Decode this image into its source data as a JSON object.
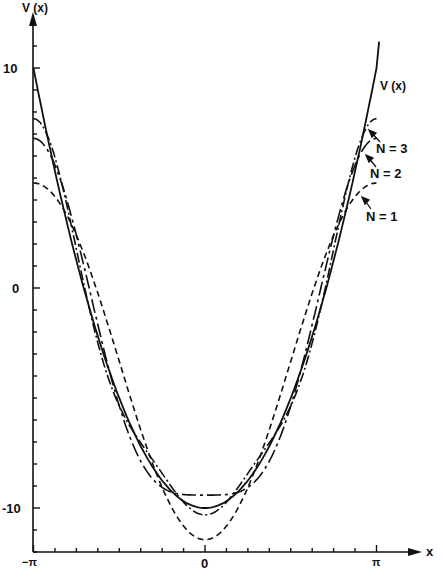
{
  "chart_data": {
    "type": "line",
    "title": "",
    "xlabel": "x",
    "ylabel": "V(x)",
    "xlim": [
      -3.14159,
      3.14159
    ],
    "ylim": [
      -12,
      12
    ],
    "x_ticks": {
      "labels": [
        "-π",
        "0",
        "π"
      ],
      "values": [
        -3.14159,
        0,
        3.14159
      ],
      "minor_step": 0.4
    },
    "y_ticks": {
      "labels": [
        "10",
        "0",
        "-10"
      ],
      "values": [
        10,
        0,
        -10
      ],
      "minor_step": 1
    },
    "grid": false,
    "legend": "inline annotations with arrows",
    "series": [
      {
        "name": "V(x)",
        "style": "solid",
        "formula": "20*(x/pi)^2 - 10",
        "x": [
          -3.1416,
          -1.5708,
          0,
          1.5708,
          3.1416
        ],
        "values": [
          10,
          -5,
          -10,
          -5,
          10
        ]
      },
      {
        "name": "N = 1",
        "style": "dashed",
        "formula": "-3.333 - 8.106*cos(x)",
        "x": [
          -3.1416,
          -1.5708,
          0,
          1.5708,
          3.1416
        ],
        "values": [
          4.77,
          -3.33,
          -11.44,
          -3.33,
          4.77
        ]
      },
      {
        "name": "N = 2",
        "style": "long-dash-dot",
        "formula": "N1 + 2.026*cos(2x)",
        "x": [
          -3.1416,
          -1.5708,
          0,
          1.5708,
          3.1416
        ],
        "values": [
          6.8,
          -5.36,
          -9.41,
          -5.36,
          6.8
        ]
      },
      {
        "name": "N = 3",
        "style": "dash-dot",
        "formula": "N2 - 0.9007*cos(3x)",
        "x": [
          -3.1416,
          -1.5708,
          0,
          1.5708,
          3.1416
        ],
        "values": [
          7.7,
          -5.36,
          -10.31,
          -5.36,
          7.7
        ]
      }
    ],
    "annotations": [
      "V(x)",
      "N = 3",
      "N = 2",
      "N = 1"
    ]
  },
  "labels": {
    "y_axis": "V (x)",
    "x_axis": "x",
    "y10": "10",
    "y0": "0",
    "yneg10": "-10",
    "xneg": "−π",
    "x0": "0",
    "xpos": "π",
    "vx": "V (x)",
    "n3": "N = 3",
    "n2": "N = 2",
    "n1": "N = 1"
  }
}
